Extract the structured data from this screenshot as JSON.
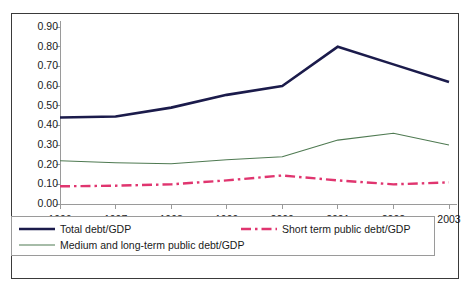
{
  "chart_data": {
    "type": "line",
    "title": "",
    "subtitle": "",
    "xlabel": "",
    "ylabel": "",
    "categories": [
      "1996",
      "1997",
      "1998",
      "1999",
      "2000",
      "2001",
      "2002",
      "2003"
    ],
    "x": [
      1996,
      1997,
      1998,
      1999,
      2000,
      2001,
      2002,
      2003
    ],
    "ylim": [
      0.0,
      0.9
    ],
    "xlim": [
      1996,
      2003
    ],
    "ytick_labels": [
      "0.00",
      "0.10",
      "0.20",
      "0.30",
      "0.40",
      "0.50",
      "0.60",
      "0.70",
      "0.80",
      "0.90"
    ],
    "ytick_values": [
      0.0,
      0.1,
      0.2,
      0.3,
      0.4,
      0.5,
      0.6,
      0.7,
      0.8,
      0.9
    ],
    "grid": false,
    "legend_position": "bottom",
    "series": [
      {
        "name": "Total debt/GDP",
        "color": "#1b1b4b",
        "style": "solid",
        "width": 2.6,
        "values": [
          0.44,
          0.445,
          0.49,
          0.555,
          0.6,
          0.8,
          0.71,
          0.62
        ]
      },
      {
        "name": "Medium and long-term public  debt/GDP",
        "color": "#4f7a52",
        "style": "solid",
        "width": 1.1,
        "values": [
          0.22,
          0.21,
          0.205,
          0.225,
          0.24,
          0.325,
          0.36,
          0.3
        ]
      },
      {
        "name": "Short term public debt/GDP",
        "color": "#e0356f",
        "style": "dashdot",
        "width": 2.4,
        "values": [
          0.09,
          0.093,
          0.1,
          0.12,
          0.145,
          0.12,
          0.1,
          0.11
        ]
      }
    ]
  },
  "axis": {
    "line_color": "#9a9a9a",
    "tick_color": "#9a9a9a"
  },
  "legend": {
    "entries": [
      {
        "label": "Total debt/GDP",
        "color": "#1b1b4b",
        "style": "solid",
        "width": 2.6
      },
      {
        "label": "Medium and long-term public  debt/GDP",
        "color": "#4f7a52",
        "style": "solid",
        "width": 1.1
      },
      {
        "label": "Short term public debt/GDP",
        "color": "#e0356f",
        "style": "dashdot",
        "width": 2.4
      }
    ]
  },
  "frame": {
    "border_color": "#3a3a3a",
    "background": "#ffffff"
  }
}
